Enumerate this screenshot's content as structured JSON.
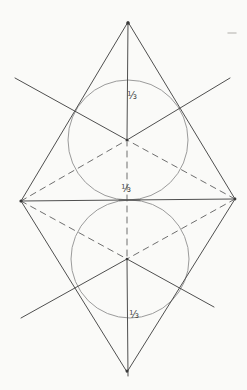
{
  "canvas": {
    "width": 247,
    "height": 390,
    "background": "#fafaf8"
  },
  "colors": {
    "solid_line": "#4f4f4f",
    "dashed_line": "#6f6f6f",
    "circle_stroke": "#9b9b9b",
    "label_text": "#3f3f3f",
    "dot_fill": "#3a3a3a",
    "stray_mark": "#c9c7c3"
  },
  "stroke": {
    "solid_width": 1,
    "dashed_width": 1,
    "circle_width": 1,
    "dash_pattern": "6 5"
  },
  "points": {
    "top_apex": [
      128,
      22
    ],
    "left_vertex": [
      21,
      201
    ],
    "right_vertex": [
      235,
      199
    ],
    "bottom_apex": [
      127,
      372
    ],
    "top_centroid": [
      127,
      140
    ],
    "bottom_centroid": [
      127,
      259
    ]
  },
  "solid_lines": [
    {
      "name": "top-triangle-left-edge",
      "x1": 128,
      "y1": 22,
      "x2": 21,
      "y2": 201
    },
    {
      "name": "top-triangle-right-edge",
      "x1": 128,
      "y1": 22,
      "x2": 235,
      "y2": 199
    },
    {
      "name": "shared-base-horizontal",
      "x1": 21,
      "y1": 201,
      "x2": 235,
      "y2": 199
    },
    {
      "name": "bottom-triangle-left-edge",
      "x1": 21,
      "y1": 201,
      "x2": 127,
      "y2": 372
    },
    {
      "name": "bottom-triangle-right-edge",
      "x1": 235,
      "y1": 199,
      "x2": 127,
      "y2": 372
    },
    {
      "name": "vertical-axis-top-solid",
      "x1": 128,
      "y1": 22,
      "x2": 127,
      "y2": 140
    },
    {
      "name": "vertical-axis-bottom-solid",
      "x1": 127,
      "y1": 259,
      "x2": 128,
      "y2": 376
    },
    {
      "name": "top-median-extension-upper-left",
      "x1": 15,
      "y1": 78,
      "x2": 127,
      "y2": 140
    },
    {
      "name": "top-median-extension-upper-right",
      "x1": 230,
      "y1": 78,
      "x2": 127,
      "y2": 140
    },
    {
      "name": "bottom-median-extension-lower-right",
      "x1": 127,
      "y1": 259,
      "x2": 214,
      "y2": 307
    },
    {
      "name": "bottom-median-extension-lower-left",
      "x1": 127,
      "y1": 259,
      "x2": 21,
      "y2": 318
    },
    {
      "name": "tangent-point-ink-overlap",
      "x1": 119,
      "y1": 200,
      "x2": 140,
      "y2": 200
    }
  ],
  "dashed_lines": [
    {
      "name": "dashed-left-vertex-to-top-centroid",
      "x1": 21,
      "y1": 201,
      "x2": 127,
      "y2": 140
    },
    {
      "name": "dashed-right-vertex-to-top-centroid",
      "x1": 235,
      "y1": 199,
      "x2": 127,
      "y2": 140
    },
    {
      "name": "dashed-left-vertex-to-bottom-centroid",
      "x1": 21,
      "y1": 201,
      "x2": 127,
      "y2": 259
    },
    {
      "name": "dashed-right-vertex-to-bottom-centroid",
      "x1": 235,
      "y1": 199,
      "x2": 127,
      "y2": 259
    },
    {
      "name": "dashed-vertical-between-centroids",
      "x1": 127,
      "y1": 140,
      "x2": 127,
      "y2": 259
    }
  ],
  "circles": [
    {
      "name": "top-inscribed-circle",
      "cx": 128,
      "cy": 140,
      "r": 60
    },
    {
      "name": "bottom-inscribed-circle",
      "cx": 130,
      "cy": 259,
      "r": 59
    }
  ],
  "dots": [
    {
      "name": "top-apex-dot",
      "x": 128,
      "y": 23,
      "r": 1.8
    },
    {
      "name": "bottom-apex-dot",
      "x": 127,
      "y": 371,
      "r": 1.5
    },
    {
      "name": "top-centroid-dot",
      "x": 127,
      "y": 140,
      "r": 1.3
    },
    {
      "name": "bottom-centroid-dot",
      "x": 127,
      "y": 259,
      "r": 1.3
    },
    {
      "name": "left-vertex-dot",
      "x": 21,
      "y": 201,
      "r": 1.6
    },
    {
      "name": "right-vertex-dot",
      "x": 235,
      "y": 199,
      "r": 1.4
    }
  ],
  "labels": [
    {
      "name": "fraction-label-top",
      "text": "⅓",
      "x": 132,
      "y": 99
    },
    {
      "name": "fraction-label-middle",
      "text": "⅓",
      "x": 126,
      "y": 192
    },
    {
      "name": "fraction-label-bottom",
      "text": "⅓",
      "x": 134,
      "y": 318
    }
  ],
  "stray_marks": [
    {
      "name": "paper-smudge-top-right",
      "x1": 228,
      "y1": 33,
      "x2": 236,
      "y2": 33
    }
  ]
}
